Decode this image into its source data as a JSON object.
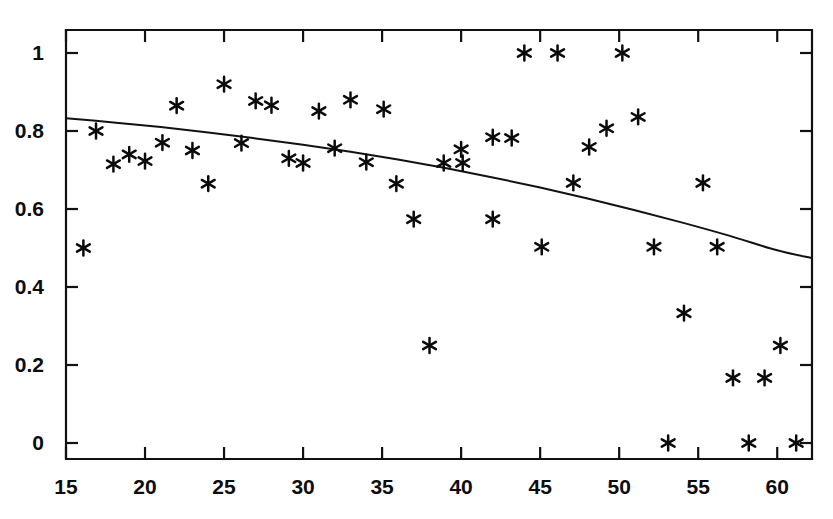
{
  "figure": {
    "background_color": "#ffffff",
    "ink_color": "#111111"
  },
  "chart_data": {
    "type": "scatter",
    "title": "",
    "subtitle": "",
    "xlabel": "",
    "ylabel": "",
    "xlim": [
      15,
      62.2
    ],
    "ylim": [
      -0.035,
      1.04
    ],
    "grid": false,
    "legend": null,
    "marker": "asterisk",
    "marker_color": "#0b0b0b",
    "x_ticks": [
      15,
      20,
      25,
      30,
      35,
      40,
      45,
      50,
      55,
      60
    ],
    "x_tick_labels": [
      "15",
      "20",
      "25",
      "30",
      "35",
      "40",
      "45",
      "50",
      "55",
      "60"
    ],
    "y_ticks": [
      0,
      0.2,
      0.4,
      0.6,
      0.8,
      1
    ],
    "y_tick_labels": [
      "0",
      "0.2",
      "0.4",
      "0.6",
      "0.8",
      "1"
    ],
    "points": [
      {
        "x": 16.1,
        "y": 0.5
      },
      {
        "x": 16.9,
        "y": 0.8
      },
      {
        "x": 18.0,
        "y": 0.715
      },
      {
        "x": 19.0,
        "y": 0.74
      },
      {
        "x": 20.0,
        "y": 0.723
      },
      {
        "x": 21.1,
        "y": 0.77
      },
      {
        "x": 22.0,
        "y": 0.865
      },
      {
        "x": 23.0,
        "y": 0.75
      },
      {
        "x": 24.0,
        "y": 0.665
      },
      {
        "x": 25.0,
        "y": 0.92
      },
      {
        "x": 26.1,
        "y": 0.769
      },
      {
        "x": 27.0,
        "y": 0.877
      },
      {
        "x": 28.0,
        "y": 0.866
      },
      {
        "x": 29.1,
        "y": 0.73
      },
      {
        "x": 30.0,
        "y": 0.718
      },
      {
        "x": 31.0,
        "y": 0.851
      },
      {
        "x": 32.0,
        "y": 0.756
      },
      {
        "x": 33.0,
        "y": 0.88
      },
      {
        "x": 34.0,
        "y": 0.72
      },
      {
        "x": 35.1,
        "y": 0.856
      },
      {
        "x": 35.9,
        "y": 0.665
      },
      {
        "x": 37.0,
        "y": 0.574
      },
      {
        "x": 38.0,
        "y": 0.25
      },
      {
        "x": 38.9,
        "y": 0.718
      },
      {
        "x": 40.1,
        "y": 0.718
      },
      {
        "x": 40.0,
        "y": 0.753
      },
      {
        "x": 42.0,
        "y": 0.784
      },
      {
        "x": 42.0,
        "y": 0.574
      },
      {
        "x": 43.2,
        "y": 0.782
      },
      {
        "x": 44.0,
        "y": 1.0
      },
      {
        "x": 45.1,
        "y": 0.503
      },
      {
        "x": 46.1,
        "y": 1.0
      },
      {
        "x": 47.1,
        "y": 0.667
      },
      {
        "x": 48.1,
        "y": 0.759
      },
      {
        "x": 49.2,
        "y": 0.807
      },
      {
        "x": 50.2,
        "y": 1.0
      },
      {
        "x": 51.2,
        "y": 0.836
      },
      {
        "x": 52.2,
        "y": 0.503
      },
      {
        "x": 53.1,
        "y": 0.0
      },
      {
        "x": 54.1,
        "y": 0.333
      },
      {
        "x": 55.3,
        "y": 0.667
      },
      {
        "x": 56.2,
        "y": 0.503
      },
      {
        "x": 57.2,
        "y": 0.167
      },
      {
        "x": 58.2,
        "y": 0.0
      },
      {
        "x": 59.2,
        "y": 0.167
      },
      {
        "x": 60.2,
        "y": 0.25
      },
      {
        "x": 61.2,
        "y": 0.0
      }
    ],
    "series": [
      {
        "name": "fitted-trend",
        "type": "line",
        "x": [
          15.0,
          18.0,
          21.0,
          24.0,
          27.0,
          30.0,
          33.0,
          36.0,
          39.0,
          42.0,
          45.0,
          48.0,
          51.0,
          54.0,
          57.0,
          60.0,
          62.2
        ],
        "y": [
          0.833,
          0.822,
          0.81,
          0.796,
          0.781,
          0.765,
          0.747,
          0.727,
          0.705,
          0.681,
          0.655,
          0.627,
          0.597,
          0.565,
          0.531,
          0.494,
          0.474
        ]
      }
    ]
  },
  "bleed_through": {
    "line_one": "",
    "line_two": ""
  }
}
